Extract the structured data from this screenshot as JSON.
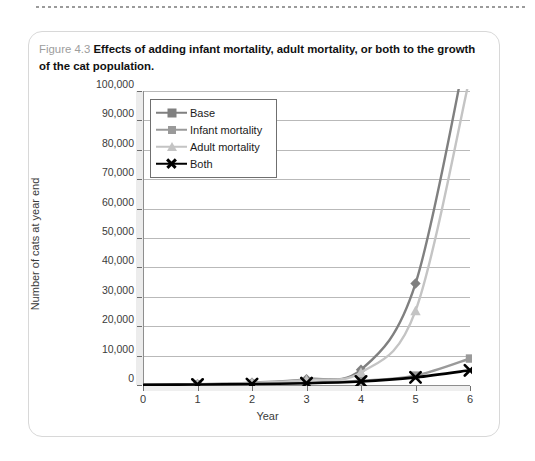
{
  "page": {
    "figure_number": "Figure 4.3",
    "caption": "Effects of adding infant mortality, adult mortality, or both to the growth of the cat population."
  },
  "chart_data": {
    "type": "line",
    "title": "",
    "xlabel": "Year",
    "ylabel": "Number of cats at year end",
    "x": [
      0,
      1,
      2,
      3,
      4,
      5,
      6
    ],
    "xlim": [
      0,
      6
    ],
    "ylim": [
      0,
      100000
    ],
    "xticks": [
      "0",
      "1",
      "2",
      "3",
      "4",
      "5",
      "6"
    ],
    "yticks": [
      "0",
      "10,000",
      "20,000",
      "30,000",
      "40,000",
      "50,000",
      "60,000",
      "70,000",
      "80,000",
      "90,000",
      "100,000"
    ],
    "ytick_values": [
      0,
      10000,
      20000,
      30000,
      40000,
      50000,
      60000,
      70000,
      80000,
      90000,
      100000
    ],
    "grid": true,
    "legend_position": "upper-left-inside",
    "series": [
      {
        "name": "Base",
        "marker": "diamond",
        "color": "#808080",
        "values": [
          100,
          300,
          800,
          2000,
          5200,
          34500,
          120000
        ]
      },
      {
        "name": "Infant mortality",
        "marker": "square",
        "color": "#9a9a9a",
        "values": [
          100,
          200,
          400,
          800,
          1500,
          3200,
          9000
        ]
      },
      {
        "name": "Adult mortality",
        "marker": "triangle",
        "color": "#c4c4c4",
        "values": [
          100,
          260,
          700,
          1700,
          4300,
          25200,
          105000
        ]
      },
      {
        "name": "Both",
        "marker": "x",
        "color": "#000000",
        "values": [
          100,
          180,
          330,
          620,
          1200,
          2600,
          5000
        ]
      }
    ]
  }
}
